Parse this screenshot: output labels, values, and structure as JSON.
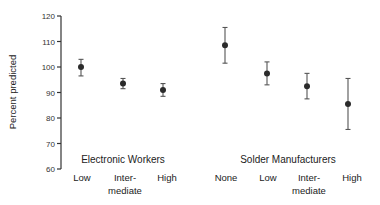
{
  "chart_data": {
    "type": "scatter",
    "title": "",
    "xlabel": "",
    "ylabel": "Percent predicted",
    "ylim": [
      60,
      120
    ],
    "yticks": [
      60,
      70,
      80,
      90,
      100,
      110,
      120
    ],
    "grid": false,
    "legend": null,
    "groups": [
      {
        "name": "Electronic Workers",
        "categories": [
          "Low",
          "Inter-\nmediate",
          "High"
        ],
        "points": [
          {
            "category": "Low",
            "value": 100,
            "lower": 96.5,
            "upper": 103
          },
          {
            "category": "Intermediate",
            "value": 93.5,
            "lower": 91.5,
            "upper": 95.5
          },
          {
            "category": "High",
            "value": 91,
            "lower": 88.5,
            "upper": 93.5
          }
        ]
      },
      {
        "name": "Solder Manufacturers",
        "categories": [
          "None",
          "Low",
          "Inter-\nmediate",
          "High"
        ],
        "points": [
          {
            "category": "None",
            "value": 108.5,
            "lower": 101.5,
            "upper": 115.5
          },
          {
            "category": "Low",
            "value": 97.5,
            "lower": 93,
            "upper": 102
          },
          {
            "category": "Intermediate",
            "value": 92.5,
            "lower": 87.5,
            "upper": 97.5
          },
          {
            "category": "High",
            "value": 85.5,
            "lower": 75.5,
            "upper": 95.5
          }
        ]
      }
    ]
  },
  "labels": {
    "ylabel": "Percent predicted",
    "yticks": [
      "120",
      "110",
      "100",
      "90",
      "80",
      "70",
      "60"
    ],
    "group1": "Electronic Workers",
    "group2": "Solder Manufacturers",
    "g1_cats": [
      "Low",
      "Inter-",
      "mediate",
      "High"
    ],
    "g2_cats": [
      "None",
      "Low",
      "Inter-",
      "mediate",
      "High"
    ]
  },
  "colors": {
    "marker": "#2b2b2b",
    "errorbar": "#555555",
    "axis": "#333333"
  }
}
